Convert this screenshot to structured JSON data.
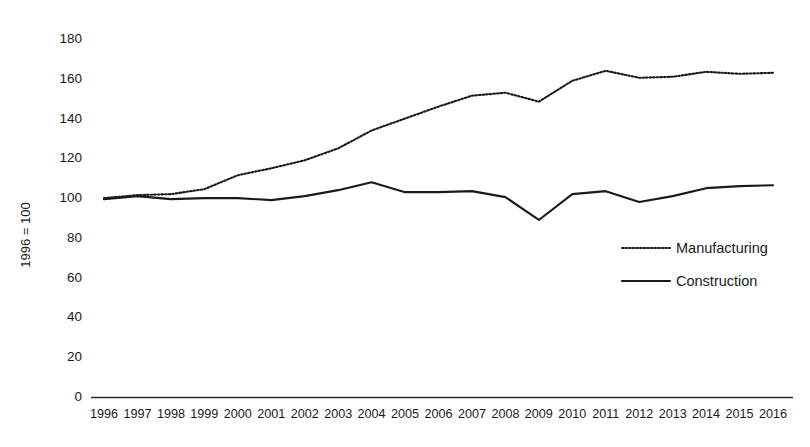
{
  "chart_data": {
    "type": "line",
    "title": "",
    "subtitle": "",
    "xlabel": "",
    "ylabel": "1996 = 100",
    "ylim": [
      0,
      180
    ],
    "ytick_step": 20,
    "yticks": [
      0,
      20,
      40,
      60,
      80,
      100,
      120,
      140,
      160,
      180
    ],
    "grid": false,
    "legend_position": "inside-right",
    "categories": [
      "1996",
      "1997",
      "1998",
      "1999",
      "2000",
      "2001",
      "2002",
      "2003",
      "2004",
      "2005",
      "2006",
      "2007",
      "2008",
      "2009",
      "2010",
      "2011",
      "2012",
      "2013",
      "2014",
      "2015",
      "2016"
    ],
    "series": [
      {
        "name": "Manufacturing",
        "style": "dotted",
        "color": "#1a1a1a",
        "values": [
          99.5,
          101.0,
          101.5,
          104.0,
          111.0,
          114.5,
          118.5,
          124.5,
          133.5,
          139.5,
          145.5,
          151.0,
          152.5,
          148.0,
          158.5,
          163.5,
          160.0,
          160.5,
          163.0,
          162.0,
          162.5
        ]
      },
      {
        "name": "Construction",
        "style": "solid",
        "color": "#1a1a1a",
        "values": [
          99.0,
          100.5,
          99.0,
          99.5,
          99.5,
          98.5,
          100.5,
          103.5,
          107.5,
          102.5,
          102.5,
          103.0,
          100.0,
          88.5,
          101.5,
          103.0,
          97.5,
          100.5,
          104.5,
          105.5,
          106.0
        ]
      }
    ]
  },
  "legend": {
    "items": [
      {
        "label": "Manufacturing",
        "style": "dotted"
      },
      {
        "label": "Construction",
        "style": "solid"
      }
    ]
  },
  "axes": {
    "y_title": "1996 = 100"
  }
}
